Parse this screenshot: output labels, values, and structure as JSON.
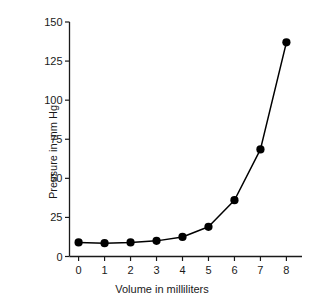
{
  "chart_data": {
    "type": "line",
    "title": "",
    "xlabel": "Volume in milliliters",
    "ylabel": "Pressure in mm Hg",
    "x": [
      0,
      1,
      2,
      3,
      4,
      5,
      6,
      7,
      8
    ],
    "values": [
      9,
      8.5,
      9,
      10,
      12.5,
      19,
      36,
      68.5,
      137
    ],
    "series": [
      {
        "name": "Pressure",
        "values": [
          9,
          8.5,
          9,
          10,
          12.5,
          19,
          36,
          68.5,
          137
        ]
      }
    ],
    "xlim": [
      -0.35,
      8.6
    ],
    "ylim": [
      0,
      150
    ],
    "xticks": [
      0,
      1,
      2,
      3,
      4,
      5,
      6,
      7,
      8
    ],
    "xtick_labels": [
      "0",
      "1",
      "2",
      "3",
      "4",
      "5",
      "6",
      "7",
      "8"
    ],
    "yticks": [
      0,
      25,
      50,
      75,
      100,
      125,
      150
    ],
    "ytick_labels": [
      "0",
      "25",
      "50",
      "75",
      "100",
      "125",
      "150"
    ],
    "grid": false,
    "legend": "none",
    "marker": "filled-circle",
    "line_color": "#000000",
    "marker_color": "#000000",
    "axis_color": "#000000",
    "background_color": "#ffffff"
  }
}
